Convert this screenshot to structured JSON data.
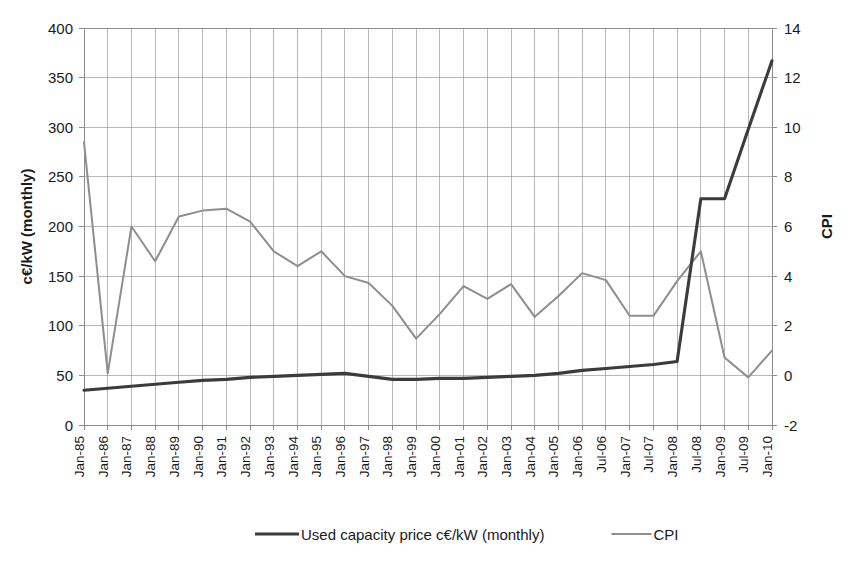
{
  "chart_data": {
    "type": "line",
    "title": "",
    "xlabel": "",
    "ylabel": "c€/kW (monthly)",
    "y2label": "CPI",
    "ylim": [
      0,
      400
    ],
    "y2lim": [
      -2,
      14
    ],
    "yticks": [
      0,
      50,
      100,
      150,
      200,
      250,
      300,
      350,
      400
    ],
    "y2ticks": [
      -2,
      0,
      2,
      4,
      6,
      8,
      10,
      12,
      14
    ],
    "grid": true,
    "legend_position": "bottom",
    "categories": [
      "Jan-85",
      "Jan-86",
      "Jan-87",
      "Jan-88",
      "Jan-89",
      "Jan-90",
      "Jan-91",
      "Jan-92",
      "Jan-93",
      "Jan-94",
      "Jan-95",
      "Jan-96",
      "Jan-97",
      "Jan-98",
      "Jan-99",
      "Jan-00",
      "Jan-01",
      "Jan-02",
      "Jan-03",
      "Jan-04",
      "Jan-05",
      "Jan-06",
      "Jul-06",
      "Jan-07",
      "Jul-07",
      "Jan-08",
      "Jul-08",
      "Jan-09",
      "Jul-09",
      "Jan-10"
    ],
    "series": [
      {
        "name": "Used capacity price c€/kW (monthly)",
        "axis": "left",
        "unit": "c€/kW",
        "color": "#3b3b3b",
        "values": [
          35,
          37,
          39,
          41,
          43,
          45,
          46,
          48,
          49,
          50,
          51,
          52,
          49,
          46,
          46,
          47,
          47,
          48,
          49,
          50,
          52,
          55,
          57,
          59,
          61,
          64,
          228,
          228,
          298,
          367
        ]
      },
      {
        "name": "CPI",
        "axis": "right",
        "unit": "CPI",
        "color": "#8e8e8e",
        "values_left_scale": [
          285,
          52,
          200,
          165,
          210,
          216,
          218,
          205,
          175,
          160,
          175,
          150,
          143,
          120,
          87,
          112,
          140,
          127,
          142,
          109,
          130,
          153,
          146,
          110,
          110,
          145,
          175,
          68,
          48,
          75
        ],
        "values": [
          9.6,
          0.1,
          6.0,
          4.6,
          6.4,
          6.6,
          6.7,
          6.2,
          5.0,
          4.4,
          5.0,
          4.0,
          3.7,
          2.8,
          1.5,
          2.5,
          3.6,
          3.1,
          3.7,
          2.4,
          3.2,
          4.1,
          3.8,
          2.4,
          2.4,
          3.8,
          5.0,
          0.7,
          -0.1,
          1.0
        ]
      }
    ],
    "legend": [
      {
        "label": "Used capacity price c€/kW (monthly)",
        "color": "#3b3b3b",
        "style": "thick"
      },
      {
        "label": "CPI",
        "color": "#8e8e8e",
        "style": "thin"
      }
    ]
  }
}
